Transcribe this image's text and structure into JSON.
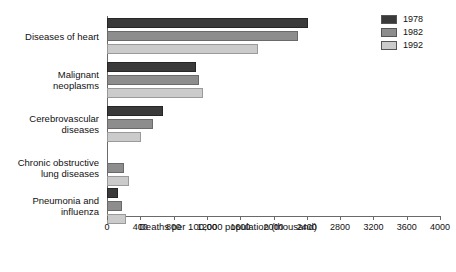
{
  "chart_data": {
    "type": "bar",
    "orientation": "horizontal",
    "title": "",
    "xlabel": "Deaths per 100,000 population (thousand)",
    "ylabel": "",
    "xlim": [
      0,
      4000
    ],
    "xticks": [
      0,
      400,
      800,
      1200,
      1600,
      2000,
      2400,
      2800,
      3200,
      3600,
      4000
    ],
    "xtick_labels": [
      "0",
      "400",
      "800",
      "1200",
      "1600",
      "2000",
      "2400",
      "2800",
      "3200",
      "3600",
      "4000"
    ],
    "grid": false,
    "legend_position": "top-right",
    "categories": [
      "Diseases of heart",
      "Malignant neoplasms",
      "Cerebrovascular diseases",
      "Chronic obstructive lung diseases",
      "Pneumonia and influenza"
    ],
    "category_label_lines": [
      [
        "Diseases of heart"
      ],
      [
        "Malignant",
        "neoplasms"
      ],
      [
        "Cerebrovascular",
        "diseases"
      ],
      [
        "Chronic obstructive",
        "lung diseases"
      ],
      [
        "Pneumonia and",
        "influenza"
      ]
    ],
    "series": [
      {
        "name": "1978",
        "color": "#3a3a3a",
        "values": [
          2420,
          1070,
          670,
          0,
          130
        ]
      },
      {
        "name": "1982",
        "color": "#8d8d8d",
        "values": [
          2290,
          1105,
          550,
          210,
          180
        ]
      },
      {
        "name": "1992",
        "color": "#cbcbcb",
        "values": [
          1810,
          1150,
          405,
          265,
          225
        ]
      }
    ]
  },
  "legend": {
    "items": [
      {
        "label": "1978",
        "color": "#3a3a3a"
      },
      {
        "label": "1982",
        "color": "#8d8d8d"
      },
      {
        "label": "1992",
        "color": "#cbcbcb"
      }
    ]
  },
  "axis": {
    "x_title": "Deaths per 100,000 population (thousand)"
  }
}
